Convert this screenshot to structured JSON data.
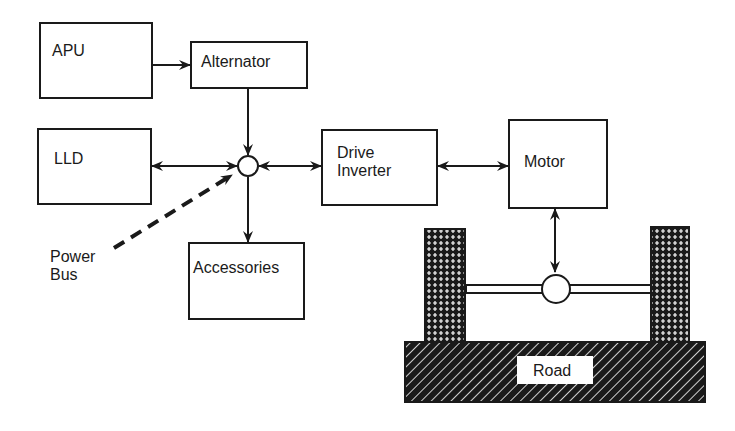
{
  "diagram": {
    "blocks": {
      "apu": "APU",
      "alternator": "Alternator",
      "lld": "LLD",
      "accessories": "Accessories",
      "drive_inverter_line1": "Drive",
      "drive_inverter_line2": "Inverter",
      "motor": "Motor",
      "road": "Road"
    },
    "annotations": {
      "power_bus_line1": "Power",
      "power_bus_line2": "Bus"
    },
    "colors": {
      "ink": "#1a1a1a",
      "background": "#ffffff"
    }
  }
}
